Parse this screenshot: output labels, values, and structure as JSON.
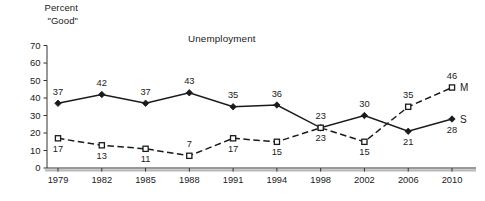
{
  "chart_data": {
    "type": "line",
    "title": "Unemployment",
    "ylabel": "Percent\n\"Good\"",
    "ylabel_line1": "Percent",
    "ylabel_line2": "\"Good\"",
    "xlabel": "",
    "x": [
      "1979",
      "1982",
      "1985",
      "1988",
      "1991",
      "1994",
      "1998",
      "2002",
      "2006",
      "2010"
    ],
    "categories": [
      "1979",
      "1982",
      "1985",
      "1988",
      "1991",
      "1994",
      "1998",
      "2002",
      "2006",
      "2010"
    ],
    "ylim": [
      0,
      70
    ],
    "yticks": [
      0,
      10,
      20,
      30,
      40,
      50,
      60,
      70
    ],
    "ytick_labels": [
      "0",
      "10",
      "20",
      "30",
      "40",
      "50",
      "60",
      "70"
    ],
    "grid": false,
    "legend_position": "line-end",
    "series": [
      {
        "name": "S",
        "end_label": "S",
        "line_style": "solid",
        "marker": "filled-diamond",
        "color": "#1a1a1a",
        "values": [
          37,
          42,
          37,
          43,
          35,
          36,
          23,
          30,
          21,
          28
        ],
        "value_labels": [
          "37",
          "42",
          "37",
          "43",
          "35",
          "36",
          "23",
          "30",
          "21",
          "28"
        ],
        "label_offsets": [
          "above",
          "above",
          "above",
          "above",
          "above",
          "above",
          "above",
          "above",
          "below",
          "below"
        ]
      },
      {
        "name": "M",
        "end_label": "M",
        "line_style": "dashed",
        "marker": "open-square",
        "color": "#1a1a1a",
        "values": [
          17,
          13,
          11,
          7,
          17,
          15,
          23,
          15,
          35,
          46
        ],
        "value_labels": [
          "17",
          "13",
          "11",
          "7",
          "17",
          "15",
          "23",
          "15",
          "35",
          "46"
        ],
        "label_offsets": [
          "below",
          "below",
          "below",
          "above",
          "below",
          "below",
          "below",
          "below",
          "above",
          "above"
        ]
      }
    ]
  },
  "colors": {
    "ink": "#1a1a1a",
    "axis": "#333333",
    "baseline_shadow": "#b9b9b9",
    "background": "#ffffff"
  }
}
